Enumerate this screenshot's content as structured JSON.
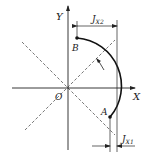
{
  "diagram": {
    "axes": {
      "x_label": "X",
      "y_label": "Y",
      "origin_label": "O"
    },
    "points": {
      "start": "A",
      "end": "B"
    },
    "dimensions": {
      "top": {
        "symbol": "J",
        "subscript": "X2"
      },
      "bottom": {
        "symbol": "J",
        "subscript": "X1"
      }
    },
    "arc_direction": "counterclockwise",
    "colors": {
      "line": "#222222",
      "dashed": "#555555",
      "background": "#ffffff"
    }
  }
}
